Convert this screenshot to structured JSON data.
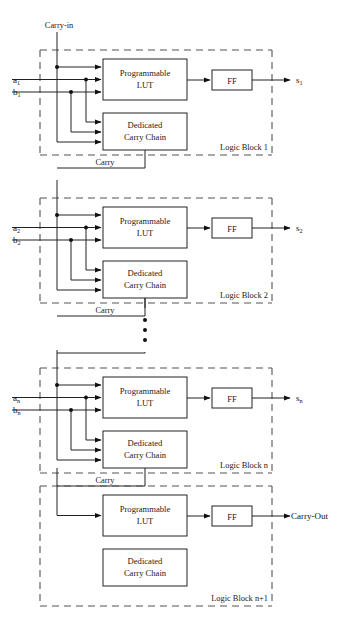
{
  "figure": {
    "top_label": "Carry-in",
    "carry_label": "Carry",
    "carry_out_label": "Carry-Out",
    "ff_label": "FF",
    "lut_label_line1": "Programmable",
    "lut_label_line2": "LUT",
    "chain_label_line1": "Dedicated",
    "chain_label_line2": "Carry Chain",
    "ellipsis_dots": 3,
    "colors": {
      "wire": "#222222",
      "dashed_border": "#555555",
      "box_fill": "#ffffff",
      "text": "#1a1a1a",
      "background": "#ffffff"
    }
  },
  "blocks": [
    {
      "id": "logic-block-1",
      "label": "Logic Block 1",
      "input_a": "a",
      "input_a_sub": "1",
      "input_b": "b",
      "input_b_sub": "1",
      "output": "s",
      "output_sub": "1",
      "has_carry_chain_wires": true,
      "carry_in_from": "Carry-in",
      "carry_out_to": "Carry"
    },
    {
      "id": "logic-block-2",
      "label": "Logic Block 2",
      "input_a": "a",
      "input_a_sub": "2",
      "input_b": "b",
      "input_b_sub": "2",
      "output": "s",
      "output_sub": "2",
      "has_carry_chain_wires": true,
      "carry_in_from": "Carry",
      "carry_out_to": "Carry"
    },
    {
      "id": "logic-block-n",
      "label": "Logic Block n",
      "input_a": "a",
      "input_a_sub": "n",
      "input_b": "b",
      "input_b_sub": "n",
      "output": "s",
      "output_sub": "n",
      "has_carry_chain_wires": true,
      "carry_in_from": "Carry",
      "carry_out_to": "Carry"
    },
    {
      "id": "logic-block-n-plus-1",
      "label": "Logic Block n+1",
      "input_a": "",
      "input_a_sub": "",
      "input_b": "",
      "input_b_sub": "",
      "output": "Carry-Out",
      "output_sub": "",
      "has_carry_chain_wires": false,
      "carry_in_from": "Carry",
      "carry_out_to": ""
    }
  ]
}
